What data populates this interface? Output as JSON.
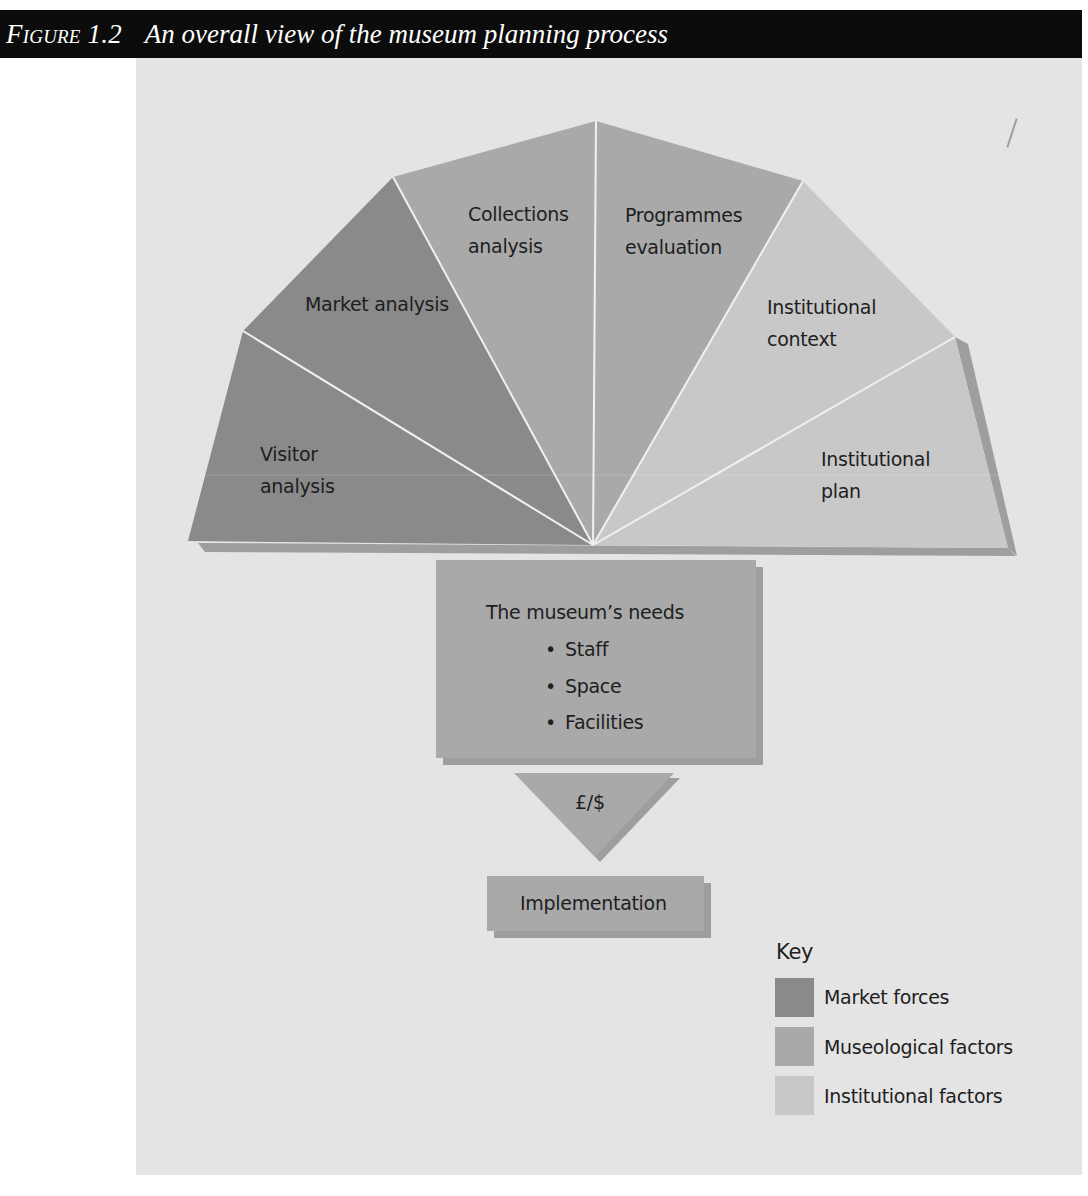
{
  "figure": {
    "number": "Figure 1.2",
    "title": "An overall view of the museum planning process"
  },
  "colors": {
    "title_bar": "#0c0c0c",
    "panel_background": "#e4e4e4",
    "market_forces": "#8a8a8a",
    "museological_factors": "#a9a9a9",
    "institutional_factors": "#c8c8c8",
    "shadow": "#9e9e9e",
    "divider": "#eeeeee"
  },
  "fan": {
    "segments": [
      {
        "label_line1": "Visitor",
        "label_line2": "analysis",
        "category": "Market forces"
      },
      {
        "label_line1": "Market analysis",
        "label_line2": "",
        "category": "Market forces"
      },
      {
        "label_line1": "Collections",
        "label_line2": "analysis",
        "category": "Museological factors"
      },
      {
        "label_line1": "Programmes",
        "label_line2": "evaluation",
        "category": "Museological factors"
      },
      {
        "label_line1": "Institutional",
        "label_line2": "context",
        "category": "Institutional factors"
      },
      {
        "label_line1": "Institutional",
        "label_line2": "plan",
        "category": "Institutional factors"
      }
    ]
  },
  "needs": {
    "title": "The museum’s needs",
    "bullet": "•",
    "items": [
      "Staff",
      "Space",
      "Facilities"
    ]
  },
  "funding": {
    "label": "£/$"
  },
  "implementation": {
    "label": "Implementation"
  },
  "key": {
    "title": "Key",
    "entries": [
      {
        "label": "Market forces",
        "color": "#8a8a8a"
      },
      {
        "label": "Museological factors",
        "color": "#a9a9a9"
      },
      {
        "label": "Institutional factors",
        "color": "#c8c8c8"
      }
    ]
  }
}
